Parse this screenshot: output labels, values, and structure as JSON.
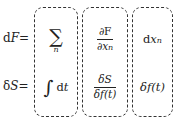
{
  "diagram": {
    "rows": [
      {
        "label": "dF=",
        "label_parts": {
          "d": "d",
          "var": "F",
          "eq": "="
        },
        "col1": {
          "symbol": "∑",
          "subscript": "n"
        },
        "col2": {
          "numerator": "∂F",
          "denominator": "∂x",
          "denominator_subscript": "n"
        },
        "col3": {
          "d": "d",
          "var": "x",
          "subscript": "n"
        }
      },
      {
        "label": "δS=",
        "label_parts": {
          "d": "δ",
          "var": "S",
          "eq": "="
        },
        "col1": {
          "symbol": "∫",
          "suffix_d": "d",
          "suffix_var": "t"
        },
        "col2": {
          "numerator": "δS",
          "denominator": "δf(t)"
        },
        "col3": {
          "text": "δf(t)"
        }
      }
    ],
    "box_style": {
      "border": "dashed",
      "color": "#333333",
      "rounded": true
    },
    "column_count": 3
  }
}
